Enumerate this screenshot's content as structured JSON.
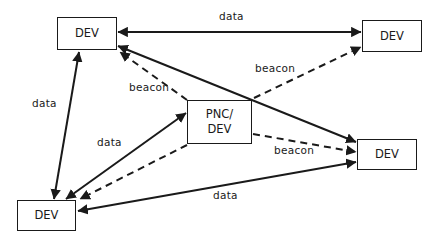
{
  "diagram": {
    "type": "network-topology",
    "nodes": [
      {
        "id": "dev_top_left",
        "label": "DEV",
        "x": 57,
        "y": 17,
        "w": 60,
        "h": 33
      },
      {
        "id": "dev_top_right",
        "label": "DEV",
        "x": 362,
        "y": 20,
        "w": 60,
        "h": 32
      },
      {
        "id": "pnc_dev",
        "label": "PNC/\nDEV",
        "x": 187,
        "y": 100,
        "w": 65,
        "h": 44
      },
      {
        "id": "dev_mid_right",
        "label": "DEV",
        "x": 357,
        "y": 139,
        "w": 60,
        "h": 31
      },
      {
        "id": "dev_bottom_left",
        "label": "DEV",
        "x": 17,
        "y": 200,
        "w": 59,
        "h": 31
      }
    ],
    "edges": [
      {
        "from": "dev_top_left",
        "to": "dev_top_right",
        "label": "data",
        "style": "solid",
        "direction": "both"
      },
      {
        "from": "dev_top_left",
        "to": "dev_bottom_left",
        "label": "data",
        "style": "solid",
        "direction": "both"
      },
      {
        "from": "dev_top_left",
        "to": "dev_mid_right",
        "label": "",
        "style": "solid",
        "direction": "both"
      },
      {
        "from": "pnc_dev",
        "to": "dev_top_left",
        "label": "beacon",
        "style": "dashed",
        "direction": "forward"
      },
      {
        "from": "pnc_dev",
        "to": "dev_top_right",
        "label": "beacon",
        "style": "dashed",
        "direction": "forward"
      },
      {
        "from": "pnc_dev",
        "to": "dev_mid_right",
        "label": "beacon",
        "style": "dashed",
        "direction": "forward"
      },
      {
        "from": "pnc_dev",
        "to": "dev_bottom_left",
        "label": "data",
        "style": "solid",
        "direction": "both"
      },
      {
        "from": "pnc_dev",
        "to": "dev_bottom_left",
        "label": "",
        "style": "dashed",
        "direction": "forward"
      },
      {
        "from": "dev_bottom_left",
        "to": "dev_mid_right",
        "label": "data",
        "style": "solid",
        "direction": "both"
      }
    ],
    "labels": {
      "data_top": "data",
      "data_left": "data",
      "data_center": "data",
      "data_bottom": "data",
      "beacon_top_left": "beacon",
      "beacon_top_right": "beacon",
      "beacon_mid_right": "beacon"
    },
    "colors": {
      "line": "#1a1a1a",
      "background": "#ffffff"
    }
  }
}
